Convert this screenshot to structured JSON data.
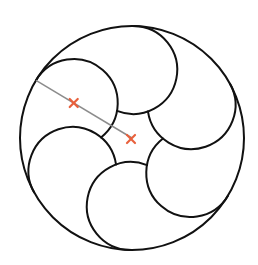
{
  "diagram": {
    "title": "Six circles inscribed in a circle (pinwheel arrangement)",
    "canvas": {
      "width": 258,
      "height": 265,
      "background": "#ffffff"
    },
    "outer_circle": {
      "cx": 132,
      "cy": 138,
      "r": 112
    },
    "petals": {
      "count": 6,
      "center_distance": 68,
      "radius": 44,
      "start_angle_deg": 31,
      "step_deg": 60
    },
    "stroke": {
      "color": "#111111",
      "width": 2
    },
    "radius_line": {
      "color": "#8c8c8c",
      "width": 1.5,
      "angle_deg": 211
    },
    "markers": [
      {
        "name": "petal-center",
        "label": "center of inner circle",
        "ref": "petal",
        "petal_angle_deg": 211
      },
      {
        "name": "main-center",
        "label": "center of outer circle",
        "ref": "outer"
      }
    ],
    "marker_style": {
      "color": "#e8603c",
      "size": 4,
      "width": 2.2
    }
  }
}
